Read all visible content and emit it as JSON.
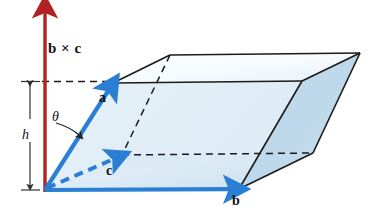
{
  "figure": {
    "background_color": "#ffffff",
    "labels": {
      "cross_product": "b × c",
      "vector_a": "a",
      "vector_b": "b",
      "vector_c": "c",
      "height": "h",
      "angle": "θ"
    },
    "colors": {
      "cross_product_arrow": "#b22222",
      "vector_arrow_blue": "#2a7fd4",
      "edge_line": "#1a1a1a",
      "face_light": "#f2f8fc",
      "face_mid": "#cfe4f2",
      "face_dark": "#bcd8ea",
      "dashed_line": "#1a1a1a",
      "text": "#111111"
    },
    "geometry": {
      "origin": [
        45,
        190
      ],
      "cross_product_tip": [
        45,
        5
      ],
      "cross_product_tail": [
        45,
        192
      ],
      "vector_a_tip": [
        113,
        83
      ],
      "vector_b_tip": [
        239,
        189
      ],
      "vector_c_tip": [
        122,
        155
      ],
      "top_face": [
        [
          113,
          83
        ],
        [
          170,
          55
        ],
        [
          360,
          53
        ],
        [
          302,
          81
        ]
      ],
      "base_face": [
        [
          45,
          190
        ],
        [
          122,
          155
        ],
        [
          313,
          153
        ],
        [
          239,
          189
        ]
      ],
      "height_dimension": {
        "x": 30,
        "y_top": 81,
        "y_bottom": 190
      }
    }
  }
}
